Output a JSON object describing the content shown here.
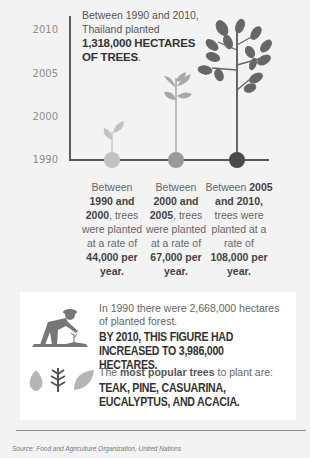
{
  "chart": {
    "years": [
      "2010",
      "2005",
      "2000",
      "1990"
    ],
    "headline": {
      "line1": "Between 1990 and 2010,",
      "line2": "Thailand planted",
      "bold1": "1,318,000 HECTARES",
      "bold2": "OF TREES",
      "period": "."
    },
    "columns": [
      {
        "pre": "Between",
        "bold_a": "1990 and",
        "bold_b": "2000",
        "mid": ", trees were planted at a rate of",
        "bold_c": "44,000 per year."
      },
      {
        "pre": "Between",
        "bold_a": "2000 and",
        "bold_b": "2005",
        "mid": ", trees were planted at a rate of",
        "bold_c": "67,000 per year."
      },
      {
        "pre": "Between ",
        "bold_a": "2005",
        "bold_b": "and 2010,",
        "mid": "trees were planted at a rate of",
        "bold_c": "108,000 per year."
      }
    ],
    "colors": {
      "light": "#c2c2c2",
      "mid": "#9a9a9a",
      "dark": "#555555",
      "axis": "#5a5a5a"
    }
  },
  "panel": {
    "intro": "In 1990 there were 2,668,000 hectares of planted forest.",
    "bold_stat": "BY 2010, THIS FIGURE HAD INCREASED TO 3,986,000 HECTARES.",
    "popular_pre": "The ",
    "popular_bold": "most popular trees",
    "popular_post": " to plant are:",
    "tree_list": "TEAK, PINE, CASUARINA, EUCALYPTUS, AND ACACIA."
  },
  "footer": {
    "source": "Source: Food and Agriculture Organization, United Nations"
  }
}
